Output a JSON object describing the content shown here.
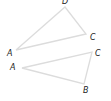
{
  "colors": {
    "edge": "#dcdcdc",
    "label": "#222222",
    "background": "#ffffff"
  },
  "triangles": [
    {
      "name": "triangle-DCA",
      "vertices": [
        {
          "label": "D",
          "x": 65,
          "y": 7,
          "lx": 62,
          "ly": 4
        },
        {
          "label": "C",
          "x": 86,
          "y": 34,
          "lx": 90,
          "ly": 40
        },
        {
          "label": "A",
          "x": 16,
          "y": 50,
          "lx": 7,
          "ly": 56
        }
      ]
    },
    {
      "name": "triangle-ACB",
      "vertices": [
        {
          "label": "A",
          "x": 22,
          "y": 68,
          "lx": 10,
          "ly": 70
        },
        {
          "label": "C",
          "x": 92,
          "y": 52,
          "lx": 95,
          "ly": 56
        },
        {
          "label": "B",
          "x": 84,
          "y": 84,
          "lx": 83,
          "ly": 93
        }
      ]
    }
  ]
}
